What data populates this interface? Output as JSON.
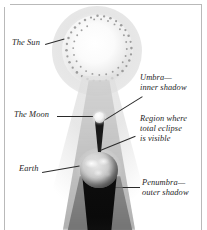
{
  "figure": {
    "type": "astronomy-diagram",
    "palette": {
      "background": "#ffffff",
      "frame": "#b9b9b9",
      "ink": "#1d1d1d",
      "umbra": "#141414",
      "penumbra": "#787878"
    }
  },
  "labels": {
    "sun": "The Sun",
    "moon": "The Moon",
    "earth": "Earth",
    "umbra_line1": "Umbra—",
    "umbra_line2": "inner shadow",
    "region_line1": "Region where",
    "region_line2": "total eclipse",
    "region_line3": "is visible",
    "penumbra_line1": "Penumbra—",
    "penumbra_line2": "outer shadow"
  },
  "bodies": {
    "sun": "sun-sphere",
    "moon": "moon-sphere",
    "earth": "earth-sphere"
  }
}
